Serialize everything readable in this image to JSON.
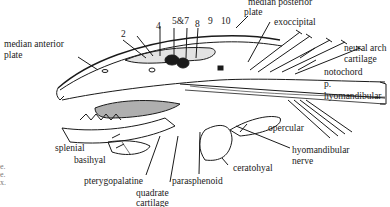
{
  "figure": {
    "labels": {
      "median_posterior_plate_l1": "median posterior",
      "median_posterior_plate_l2": "plate",
      "exoccipital": "exoccipital",
      "neural_arch_l1": "neural arch",
      "neural_arch_l2": "cartilage",
      "notochord": "notochord",
      "p": "p.",
      "hyomandibular": "hyomandibular",
      "median_anterior_l1": "median anterior",
      "median_anterior_l2": "plate",
      "n2": "2",
      "n4": "4",
      "n5_7": "5&7",
      "n8": "8",
      "n9": "9",
      "n10": "10",
      "opercular": "opercular",
      "hyomandibular_nerve_l1": "hyomandibular",
      "hyomandibular_nerve_l2": "nerve",
      "splenial": "splenial",
      "basihyal": "basihyal",
      "pterygopalatine": "pterygopalatine",
      "parasphenoid": "parasphenoid",
      "ceratohyal": "ceratohyal",
      "quadrate_l1": "quadrate",
      "quadrate_l2": "cartilage"
    },
    "caption_fragments": [
      "e.",
      "e.",
      "x."
    ],
    "colors": {
      "ink": "#1a1a1a",
      "background": "#ffffff",
      "fragment": "#777777"
    }
  }
}
